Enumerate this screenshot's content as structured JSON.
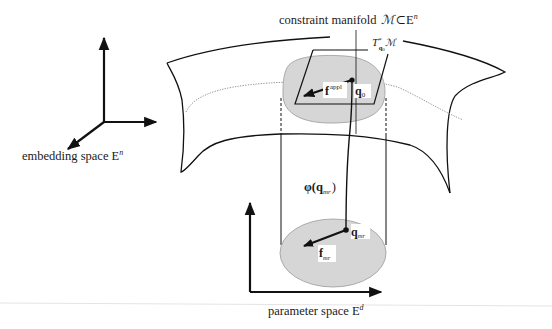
{
  "diagram": {
    "labels": {
      "embedding_space": "embedding space E",
      "embedding_space_sup": "n",
      "constraint_manifold": "constraint manifold",
      "manifold_symbol": "ℳ",
      "subset_symbol": "⊂",
      "manifold_space": "E",
      "manifold_space_sup": "n",
      "tangent_T": "T",
      "tangent_sup": "*",
      "tangent_sub": "q",
      "tangent_sub_sub": "0",
      "tangent_M": "ℳ",
      "f_appl": "f",
      "f_appl_sup": "appl",
      "q0": "q",
      "q0_sub": "0",
      "phi": "φ(",
      "phi_q": "q",
      "phi_q_sub": "mr",
      "phi_close": ")",
      "q_mr": "q",
      "q_mr_sub": "mr",
      "f_mr": "f",
      "f_mr_sub": "mr",
      "parameter_space": "parameter space E",
      "parameter_space_sup": "d"
    },
    "colors": {
      "ink": "#111111",
      "patch_fill": "#d6d6d6",
      "patch_stroke": "#9a9a9a",
      "dotted": "#888888",
      "background": "#ffffff"
    }
  }
}
